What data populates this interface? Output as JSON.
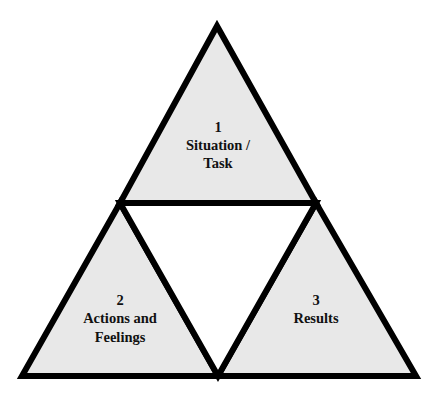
{
  "diagram": {
    "type": "triforce",
    "colors": {
      "stroke": "#000000",
      "fill": "#e8e8e8",
      "inner_fill": "#ffffff",
      "background": "#ffffff"
    },
    "triangles": [
      {
        "id": "top",
        "number": "1",
        "lines": [
          "Situation /",
          "Task"
        ]
      },
      {
        "id": "bottom-left",
        "number": "2",
        "lines": [
          "Actions and",
          "Feelings"
        ]
      },
      {
        "id": "bottom-right",
        "number": "3",
        "lines": [
          "Results"
        ]
      }
    ]
  }
}
